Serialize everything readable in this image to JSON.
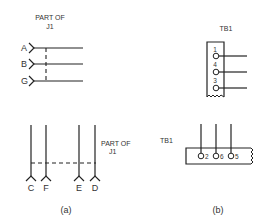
{
  "panel_a": {
    "caption": "(a)",
    "top_group": {
      "title_line1": "PART OF",
      "title_line2": "J1",
      "pins": [
        {
          "label": "A"
        },
        {
          "label": "B"
        },
        {
          "label": "G"
        }
      ]
    },
    "bottom_group": {
      "title_line1": "PART OF",
      "title_line2": "J1",
      "pins": [
        {
          "label": "C"
        },
        {
          "label": "F"
        },
        {
          "label": "E"
        },
        {
          "label": "D"
        }
      ]
    }
  },
  "panel_b": {
    "caption": "(b)",
    "top_group": {
      "title": "TB1",
      "terminals": [
        {
          "label": "1"
        },
        {
          "label": "4"
        },
        {
          "label": "3"
        }
      ]
    },
    "bottom_group": {
      "title": "TB1",
      "terminals": [
        {
          "label": "2"
        },
        {
          "label": "6"
        },
        {
          "label": "5"
        }
      ]
    }
  }
}
